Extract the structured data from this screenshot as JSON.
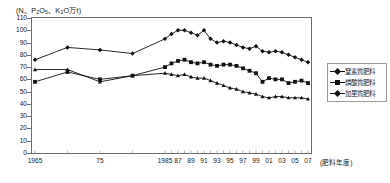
{
  "chart_data": {
    "type": "line",
    "title": "(N、P2O5、K2O万t)",
    "title_plain_parts": {
      "pre": "(N、P",
      "sub1": "2",
      "mid": "O",
      "sub2": "5",
      "post": "、K",
      "sub3": "2",
      "tail": "O万t)"
    },
    "xlabel": "(肥料年度)",
    "ylabel": "",
    "ylim": [
      0,
      110
    ],
    "yticks": [
      0,
      10,
      20,
      30,
      40,
      50,
      60,
      70,
      80,
      90,
      100,
      110
    ],
    "grid": false,
    "legend_position": "right",
    "x": [
      1965,
      1970,
      1975,
      1980,
      1985,
      1986,
      1987,
      1988,
      1989,
      1990,
      1991,
      1992,
      1993,
      1994,
      1995,
      1996,
      1997,
      1998,
      1999,
      2000,
      2001,
      2002,
      2003,
      2004,
      2005,
      2006,
      2007
    ],
    "xtick_labels": [
      "1965",
      "75",
      "1985",
      "87",
      "89",
      "91",
      "93",
      "95",
      "97",
      "99",
      "01",
      "03",
      "05",
      "07"
    ],
    "xtick_values": [
      1965,
      1975,
      1985,
      1987,
      1989,
      1991,
      1993,
      1995,
      1997,
      1999,
      2001,
      2003,
      2005,
      2007
    ],
    "series": [
      {
        "name": "窒素質肥料",
        "marker": "diamond",
        "color": "#111111",
        "values": [
          76,
          86,
          84,
          81,
          93,
          97,
          100,
          100,
          98,
          96,
          100,
          93,
          90,
          91,
          90,
          88,
          86,
          85,
          87,
          83,
          82,
          83,
          82,
          80,
          78,
          76,
          74
        ]
      },
      {
        "name": "燐酸質肥料",
        "marker": "square",
        "color": "#111111",
        "values": [
          58,
          66,
          60,
          63,
          70,
          73,
          75,
          76,
          74,
          73,
          74,
          72,
          71,
          72,
          72,
          71,
          69,
          67,
          65,
          58,
          61,
          60,
          60,
          57,
          58,
          59,
          57
        ]
      },
      {
        "name": "加里質肥料",
        "marker": "triangle",
        "color": "#111111",
        "values": [
          68,
          68,
          58,
          63,
          65,
          64,
          63,
          64,
          62,
          61,
          61,
          59,
          57,
          55,
          53,
          52,
          50,
          49,
          48,
          46,
          45,
          46,
          46,
          45,
          45,
          45,
          44
        ]
      }
    ]
  },
  "legend": {
    "items": [
      {
        "label": "窒素質肥料",
        "marker": "diamond"
      },
      {
        "label": "燐酸質肥料",
        "marker": "square"
      },
      {
        "label": "加里質肥料",
        "marker": "diamond"
      }
    ]
  }
}
